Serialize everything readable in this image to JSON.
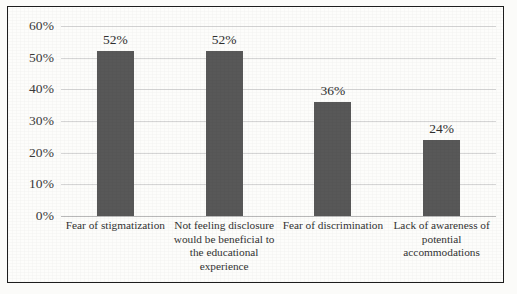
{
  "chart_data": {
    "type": "bar",
    "title": "",
    "xlabel": "",
    "ylabel": "",
    "ylim": [
      0,
      60
    ],
    "ytick_labels": [
      "60%",
      "50%",
      "40%",
      "30%",
      "20%",
      "10%",
      "0%"
    ],
    "ytick_values": [
      60,
      50,
      40,
      30,
      20,
      10,
      0
    ],
    "grid": true,
    "legend": "none",
    "categories": [
      "Fear of stigmatization",
      "Not feeling disclosure would be beneficial to the educational experience",
      "Fear of discrimination",
      "Lack of awareness of potential accommodations"
    ],
    "category_lines": [
      [
        "Fear of stigmatization"
      ],
      [
        "Not feeling disclosure",
        "would be beneficial to",
        "the educational",
        "experience"
      ],
      [
        "Fear of discrimination"
      ],
      [
        "Lack of awareness of",
        "potential",
        "accommodations"
      ]
    ],
    "values": [
      52,
      52,
      36,
      24
    ],
    "value_labels": [
      "52%",
      "52%",
      "36%",
      "24%"
    ],
    "colors": {
      "bar": "#585858",
      "gridline": "#d6d6d6",
      "axis": "#b9b9b9",
      "frame": "#1d1d1d",
      "background": "#fdfdfb",
      "text": "#333333"
    }
  }
}
